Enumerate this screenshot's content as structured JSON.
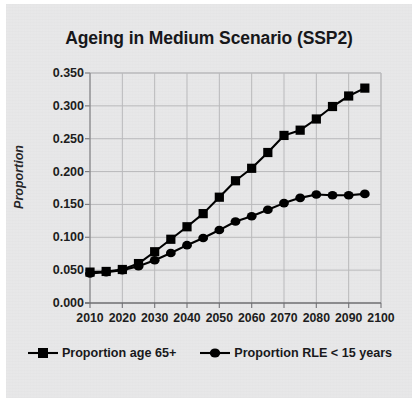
{
  "chart_data": {
    "type": "line",
    "title": "Ageing in Medium Scenario (SSP2)",
    "xlabel": "",
    "ylabel": "Proportion",
    "xlim": [
      2010,
      2100
    ],
    "ylim": [
      0.0,
      0.35
    ],
    "grid": true,
    "legend_position": "bottom",
    "xticks": [
      "2010",
      "2020",
      "2030",
      "2040",
      "2050",
      "2060",
      "2070",
      "2080",
      "2090",
      "2100"
    ],
    "yticks": [
      "0.000",
      "0.050",
      "0.100",
      "0.150",
      "0.200",
      "0.250",
      "0.300",
      "0.350"
    ],
    "x": [
      2010,
      2015,
      2020,
      2025,
      2030,
      2035,
      2040,
      2045,
      2050,
      2055,
      2060,
      2065,
      2070,
      2075,
      2080,
      2085,
      2090,
      2095
    ],
    "series": [
      {
        "name": "Proportion age 65+",
        "marker": "square",
        "color": "#000000",
        "values": [
          0.047,
          0.048,
          0.051,
          0.06,
          0.078,
          0.097,
          0.116,
          0.136,
          0.161,
          0.186,
          0.205,
          0.229,
          0.255,
          0.263,
          0.28,
          0.299,
          0.315,
          0.327
        ]
      },
      {
        "name": "Proportion RLE < 15 years",
        "marker": "circle",
        "color": "#000000",
        "values": [
          0.045,
          0.047,
          0.05,
          0.056,
          0.065,
          0.076,
          0.088,
          0.099,
          0.111,
          0.124,
          0.132,
          0.142,
          0.152,
          0.16,
          0.165,
          0.164,
          0.164,
          0.166
        ]
      }
    ]
  },
  "legend": {
    "items": [
      {
        "label": "Proportion age 65+",
        "marker": "square"
      },
      {
        "label": "Proportion RLE < 15 years",
        "marker": "circle"
      }
    ]
  }
}
